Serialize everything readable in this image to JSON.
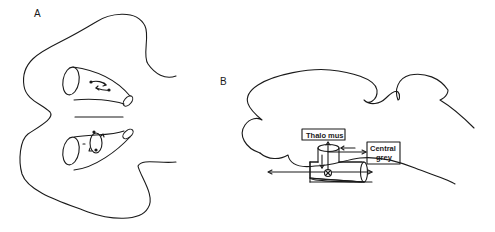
{
  "figure": {
    "panels": [
      {
        "id": "A",
        "label": "A",
        "description": "Horizontal section outline with two horn-shaped ventricular tubes showing circulating flow arrows"
      },
      {
        "id": "B",
        "label": "B",
        "description": "Sagittal brain outline with T-shaped tube; arrows to Thalamus and from Central grey",
        "boxes": {
          "thalamus": "Thalo mus",
          "central_grey_line1": "Central",
          "central_grey_line2": "grey"
        }
      }
    ]
  }
}
